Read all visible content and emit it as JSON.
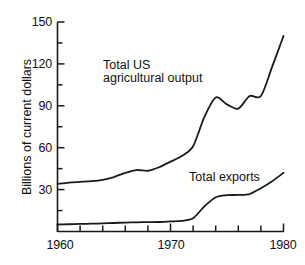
{
  "chart_data": {
    "type": "line",
    "title": "",
    "xlabel": "",
    "ylabel": "Billions of current dollars",
    "xlim": [
      1960,
      1980
    ],
    "ylim": [
      0,
      150
    ],
    "grid": false,
    "legend_position": "inline-annotation",
    "x_ticks_major": [
      1960,
      1970,
      1980
    ],
    "x_ticks_minor": [
      1962,
      1964,
      1966,
      1968,
      1972,
      1974,
      1976,
      1978
    ],
    "y_ticks_major": [
      30,
      60,
      90,
      120,
      150
    ],
    "y_ticks_minor": [
      15,
      45,
      75,
      105,
      135
    ],
    "x": [
      1960,
      1961,
      1962,
      1963,
      1964,
      1965,
      1966,
      1967,
      1968,
      1969,
      1970,
      1971,
      1972,
      1973,
      1974,
      1975,
      1976,
      1977,
      1978,
      1979,
      1980
    ],
    "series": [
      {
        "name": "Total US agricultural output",
        "values": [
          34,
          35,
          35.5,
          36,
          37,
          39,
          42,
          44,
          43.5,
          46,
          50,
          54,
          61,
          82,
          96,
          91,
          88,
          97,
          97,
          118,
          140
        ]
      },
      {
        "name": "Total exports",
        "values": [
          5,
          5.2,
          5.4,
          5.6,
          5.8,
          6.1,
          6.4,
          6.6,
          6.7,
          6.8,
          7.2,
          7.6,
          9.5,
          18,
          24.5,
          26,
          26.2,
          26.8,
          31,
          36,
          42
        ]
      }
    ],
    "annotations": [
      {
        "name": "ag-output-label",
        "text_line1": "Total US",
        "text_line2": "agricultural output"
      },
      {
        "name": "exports-label",
        "text": "Total exports"
      }
    ],
    "x_tick_labels": [
      "1960",
      "1970",
      "1980"
    ],
    "y_tick_labels": [
      "30",
      "60",
      "90",
      "120",
      "150"
    ]
  },
  "axis": {
    "y_title": "Billions of current dollars"
  },
  "labels": {
    "ag_line1": "Total US",
    "ag_line2": "agricultural output",
    "exports": "Total exports"
  },
  "ticks": {
    "y": [
      "150",
      "120",
      "90",
      "60",
      "30"
    ],
    "x": [
      "1960",
      "1970",
      "1980"
    ]
  },
  "colors": {
    "line": "#1a1a1a",
    "axis": "#1a1a1a",
    "background": "#ffffff"
  }
}
